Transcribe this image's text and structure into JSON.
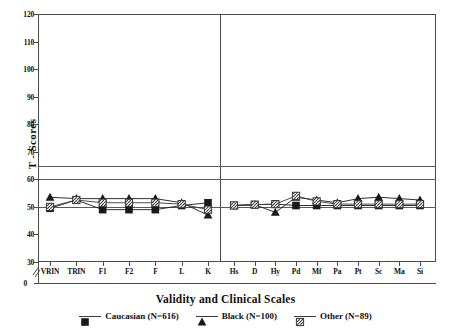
{
  "chart_data": {
    "type": "line",
    "title": "",
    "xlabel": "Validity and Clinical Scales",
    "ylabel": "T - Scores",
    "ylim": [
      30,
      120
    ],
    "y_axis_break_below": 30,
    "yticks": [
      "0",
      "30",
      "40",
      "50",
      "60",
      "70",
      "80",
      "90",
      "100",
      "110",
      "120"
    ],
    "grid": false,
    "reference_lines": [
      50,
      60,
      65
    ],
    "panel_divider_after": "K",
    "legend_position": "bottom",
    "categories": [
      "VRIN",
      "TRIN",
      "F1",
      "F2",
      "F",
      "L",
      "K",
      "Hs",
      "D",
      "Hy",
      "Pd",
      "Mf",
      "Pa",
      "Pt",
      "Sc",
      "Ma",
      "Si"
    ],
    "validity_scales": [
      "VRIN",
      "TRIN",
      "F1",
      "F2",
      "F",
      "L",
      "K"
    ],
    "clinical_scales": [
      "Hs",
      "D",
      "Hy",
      "Pd",
      "Mf",
      "Pa",
      "Pt",
      "Sc",
      "Ma",
      "Si"
    ],
    "series": [
      {
        "name": "Caucasian (N=616)",
        "label": "Caucasian (N=616)",
        "n": 616,
        "marker": "filled-square",
        "color": "#1a1a1a",
        "values": [
          49.5,
          52.5,
          49.0,
          49.0,
          49.0,
          50.5,
          51.5,
          50.5,
          50.8,
          51.0,
          50.5,
          50.5,
          50.5,
          50.5,
          50.5,
          50.5,
          50.5
        ]
      },
      {
        "name": "Black (N=100)",
        "label": "Black (N=100)",
        "n": 100,
        "marker": "filled-triangle",
        "color": "#1a1a1a",
        "values": [
          53.5,
          53.0,
          53.0,
          53.0,
          53.0,
          51.5,
          47.0,
          50.5,
          50.8,
          48.0,
          53.5,
          52.5,
          51.5,
          53.0,
          53.5,
          53.0,
          52.5
        ]
      },
      {
        "name": "Other (N=89)",
        "label": "Other (N=89)",
        "n": 89,
        "marker": "hatched-square",
        "color": "#3a3a3a",
        "values": [
          50.0,
          52.5,
          51.5,
          51.5,
          51.5,
          51.0,
          49.0,
          50.5,
          50.8,
          51.0,
          54.0,
          52.0,
          51.0,
          51.0,
          51.0,
          51.0,
          51.0
        ]
      }
    ]
  },
  "axis": {
    "ylabel": "T - Scores",
    "xlabel": "Validity and Clinical Scales"
  }
}
